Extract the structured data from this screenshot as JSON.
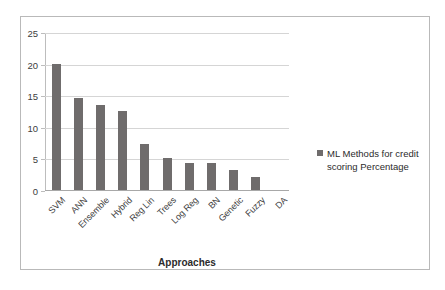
{
  "chart_data": {
    "type": "bar",
    "title": "",
    "xlabel": "Approaches",
    "ylabel": "",
    "ylim": [
      0,
      25
    ],
    "yticks": [
      0,
      5,
      10,
      15,
      20,
      25
    ],
    "grid": true,
    "legend_position": "right",
    "categories": [
      "SVM",
      "ANN",
      "Ensemble",
      "Hybrid",
      "Reg Lin",
      "Trees",
      "Log Reg",
      "BN",
      "Genetic",
      "Fuzzy",
      "DA"
    ],
    "series": [
      {
        "name": "ML Methods for credit scoring Percentage",
        "values": [
          20.0,
          14.6,
          13.5,
          12.5,
          7.3,
          5.1,
          4.2,
          4.2,
          3.1,
          2.1,
          0
        ]
      }
    ],
    "colors": {
      "bar": "#6f6c6c",
      "gridline": "#d5d5d5",
      "axis": "#bdbdbd",
      "text": "#404040",
      "frame": "#b9b9b9"
    }
  },
  "legend": {
    "label_line1": "ML Methods for credit",
    "label_line2": "scoring Percentage",
    "swatch_name": "legend-swatch"
  }
}
